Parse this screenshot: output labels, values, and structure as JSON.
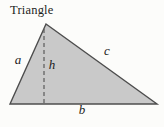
{
  "diagram": {
    "title": "Triangle",
    "shape_type": "triangle-with-altitude",
    "labels": {
      "left_side": "a",
      "base": "b",
      "right_side": "c",
      "height": "h"
    },
    "colors": {
      "fill": "#c9c9c9",
      "outline": "#4d4d4d",
      "dash": "#5a5a5a",
      "text": "#1c1c1c",
      "background": "#fcfcfa"
    }
  }
}
